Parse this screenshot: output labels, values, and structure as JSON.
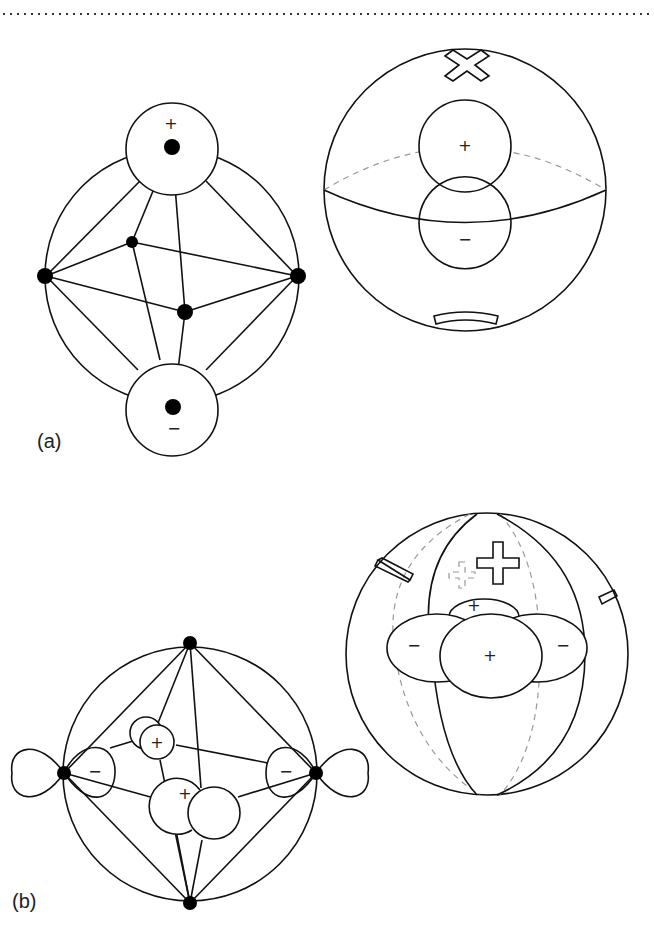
{
  "figure": {
    "top_border": "dotted-rule",
    "panels": [
      {
        "id": "a",
        "label": "(a)",
        "left_diagram": {
          "description": "octahedral ligand field with p-orbital lobes on z-axis ligands",
          "top_lobe_sign": "+",
          "bottom_lobe_sign": "−"
        },
        "right_diagram": {
          "description": "sphere with p-orbital, tensor surface harmonic",
          "upper_lobe_sign": "+",
          "lower_lobe_sign": "−",
          "top_symbol": "✖",
          "bottom_symbol": "−"
        }
      },
      {
        "id": "b",
        "label": "(b)",
        "left_diagram": {
          "description": "octahedral ligand field with d-type lobes on equatorial ligands",
          "left_lobe_sign": "−",
          "right_lobe_sign": "−",
          "back_lobe_sign": "+",
          "front_lobe_sign": "+"
        },
        "right_diagram": {
          "description": "sphere with d-orbital lobes and meridians",
          "center_lobe_sign": "+",
          "upper_lobe_sign": "+",
          "left_lobe_sign": "−",
          "right_lobe_sign": "−",
          "symbols": [
            "−",
            "+",
            "+ (dashed)",
            "−"
          ]
        }
      }
    ]
  }
}
